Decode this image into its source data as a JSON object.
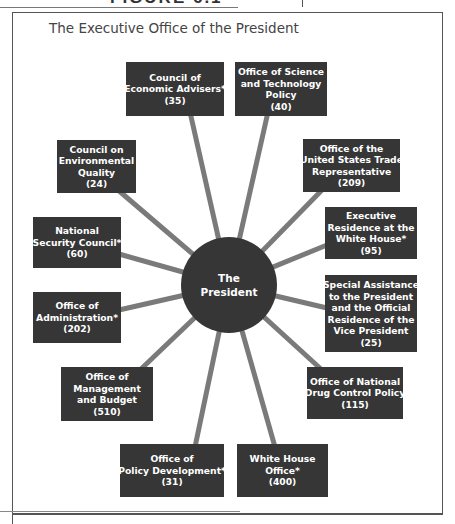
{
  "header": {
    "figure_label_clipped": "FIGURE 6.1"
  },
  "diagram": {
    "title": "The Executive Office of the President",
    "center": {
      "line1": "The",
      "line2": "President"
    },
    "offices": [
      {
        "id": "cea",
        "lines": [
          "Council of",
          "Economic Advisers*"
        ],
        "staff": "(35)"
      },
      {
        "id": "ostp",
        "lines": [
          "Office of Science",
          "and Technology",
          "Policy"
        ],
        "staff": "(40)"
      },
      {
        "id": "ceq",
        "lines": [
          "Council on",
          "Environmental",
          "Quality"
        ],
        "staff": "(24)"
      },
      {
        "id": "ustr",
        "lines": [
          "Office of the",
          "United States Trade",
          "Representative"
        ],
        "staff": "(209)"
      },
      {
        "id": "nsc",
        "lines": [
          "National",
          "Security Council*"
        ],
        "staff": "(60)"
      },
      {
        "id": "exec-residence",
        "lines": [
          "Executive",
          "Residence at the",
          "White House*"
        ],
        "staff": "(95)"
      },
      {
        "id": "oa",
        "lines": [
          "Office of",
          "Administration*"
        ],
        "staff": "(202)"
      },
      {
        "id": "special-assistance",
        "lines": [
          "Special Assistance",
          "to the President",
          "and the Official",
          "Residence of the",
          "Vice President"
        ],
        "staff": "(25)"
      },
      {
        "id": "omb",
        "lines": [
          "Office of",
          "Management",
          "and Budget"
        ],
        "staff": "(510)"
      },
      {
        "id": "ondcp",
        "lines": [
          "Office of National",
          "Drug Control Policy"
        ],
        "staff": "(115)"
      },
      {
        "id": "opd",
        "lines": [
          "Office of",
          "Policy Development*"
        ],
        "staff": "(31)"
      },
      {
        "id": "who",
        "lines": [
          "White House",
          "Office*"
        ],
        "staff": "(400)"
      }
    ]
  },
  "colors": {
    "box_fill": "#363636",
    "spoke": "#7a7a7a",
    "text_on_box": "#ffffff",
    "title_text": "#444444",
    "frame": "#555555"
  }
}
